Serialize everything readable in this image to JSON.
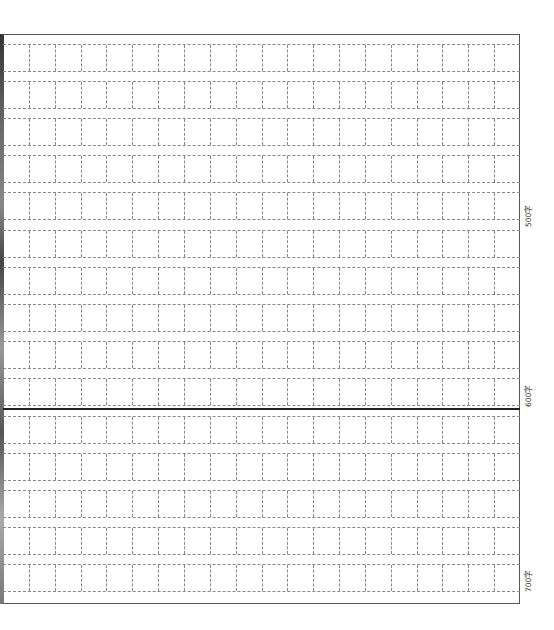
{
  "document": {
    "type": "Chinese composition grid paper",
    "columns": 20,
    "rows": 15,
    "word_count_labels": [
      {
        "text": "500字",
        "row": 5
      },
      {
        "text": "600字",
        "row": 10
      },
      {
        "text": "700字",
        "row": 15
      }
    ],
    "colors": {
      "grid_line": "#888888",
      "frame": "#555555",
      "divider": "#222222"
    }
  }
}
